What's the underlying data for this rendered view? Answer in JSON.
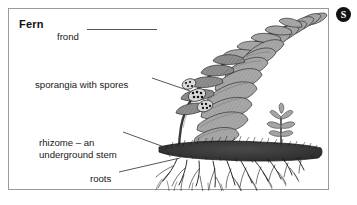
{
  "page": {
    "background_color": "#ffffff",
    "width": 357,
    "height": 205
  },
  "badge": {
    "label": "S",
    "background_color": "#111111",
    "text_color": "#ffffff"
  },
  "diagram": {
    "title": "Fern",
    "border_color": "#9a9a9a",
    "background_color": "#ffffff",
    "ink_color": "#1a1a1a",
    "frond_fill": "#a6a6a6",
    "rhizome_fill": "#3a3a3a",
    "labels": [
      {
        "id": "frond",
        "text": "frond",
        "lines": [
          "frond"
        ],
        "leader": "horizontal line pointing right to the frond tip"
      },
      {
        "id": "sporangia",
        "text": "sporangia with spores",
        "lines": [
          "sporangia with spores"
        ],
        "leader": "line sloping down-right to the spore clusters"
      },
      {
        "id": "rhizome",
        "text": "rhizome – an underground stem",
        "lines": [
          "rhizome – an",
          "underground stem"
        ],
        "leader": "line sloping down-right to the rhizome band"
      },
      {
        "id": "roots",
        "text": "roots",
        "lines": [
          "roots"
        ],
        "leader": "line sloping up-right to the root network"
      }
    ],
    "parts": [
      {
        "id": "frond",
        "name": "frond"
      },
      {
        "id": "sporangia",
        "name": "sporangia with spores"
      },
      {
        "id": "rhizome",
        "name": "rhizome"
      },
      {
        "id": "roots",
        "name": "roots"
      },
      {
        "id": "new-shoot",
        "name": "young shoot"
      },
      {
        "id": "soil-line",
        "name": "soil surface"
      }
    ]
  }
}
